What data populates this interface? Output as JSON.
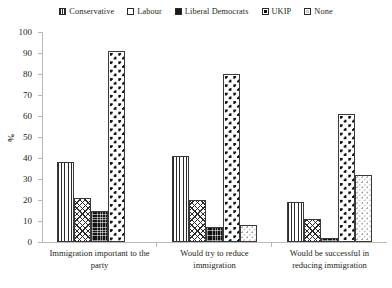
{
  "chart_data": {
    "type": "bar",
    "title": "",
    "xlabel": "",
    "ylabel": "%",
    "ylim": [
      0,
      100
    ],
    "ytick_step": 10,
    "yticks": [
      100,
      90,
      80,
      70,
      60,
      50,
      40,
      30,
      20,
      10,
      0
    ],
    "grid": false,
    "legend_position": "top",
    "categories": [
      "Immigration important to the party",
      "Would try to reduce immigration",
      "Would be successful in reducing immigration"
    ],
    "series": [
      {
        "name": "Conservative",
        "pattern": "vertical-lines",
        "values": [
          38,
          41,
          19
        ]
      },
      {
        "name": "Labour",
        "pattern": "diagonal-crosshatch",
        "values": [
          21,
          20,
          11
        ]
      },
      {
        "name": "Liberal Democrats",
        "pattern": "solid-black",
        "values": [
          15,
          7,
          2
        ]
      },
      {
        "name": "UKIP",
        "pattern": "checkered-diamond",
        "values": [
          91,
          80,
          61
        ]
      },
      {
        "name": "None",
        "pattern": "light-stipple",
        "values": [
          0,
          8,
          32
        ]
      }
    ]
  },
  "colors": {
    "axis": "#b9b9b9",
    "text": "#231f20",
    "bar_outline": "#3a3a3a",
    "ink": "#111111",
    "background": "#ffffff"
  }
}
